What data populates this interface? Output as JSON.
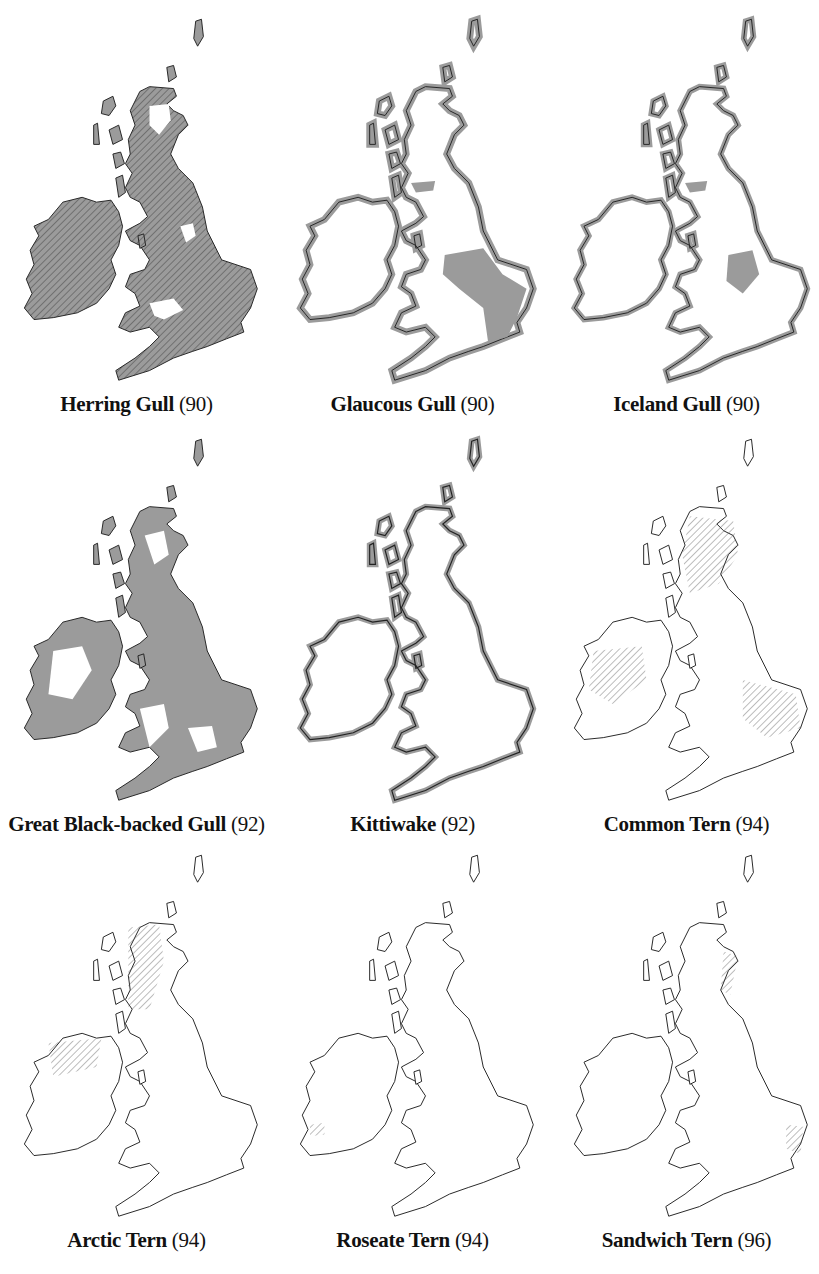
{
  "figure": {
    "colors": {
      "range_fill": "#9b9b9b",
      "outline": "#222222",
      "hatch": "#333333",
      "background": "#ffffff"
    },
    "maps": [
      {
        "name": "Herring Gull",
        "number": "(90)",
        "style": "filled-hatched",
        "caption_x": 130
      },
      {
        "name": "Glaucous Gull",
        "number": "(90)",
        "style": "coastal-inland-patch",
        "caption_x": 420
      },
      {
        "name": "Iceland Gull",
        "number": "(90)",
        "style": "coastal-inland-patch-small",
        "caption_x": 700
      },
      {
        "name": "Great Black-backed Gull",
        "number": "(92)",
        "style": "filled-gaps",
        "caption_x": 165
      },
      {
        "name": "Kittiwake",
        "number": "(92)",
        "style": "coastal-band",
        "caption_x": 420
      },
      {
        "name": "Common Tern",
        "number": "(94)",
        "style": "hatched-patches",
        "caption_x": 705
      },
      {
        "name": "Arctic Tern",
        "number": "(94)",
        "style": "hatched-coast-west",
        "caption_x": 160
      },
      {
        "name": "Roseate Tern",
        "number": "(94)",
        "style": "sparse-coastal",
        "caption_x": 420
      },
      {
        "name": "Sandwich Tern",
        "number": "(96)",
        "style": "hatched-coast-east",
        "caption_x": 705
      }
    ]
  }
}
